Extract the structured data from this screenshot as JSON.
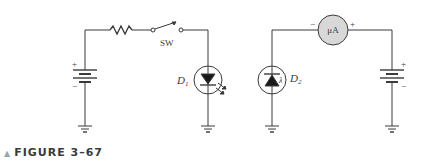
{
  "figure": {
    "caption_marker": "▲",
    "caption": "FIGURE 3–67"
  },
  "left_circuit": {
    "switch_label": "SW",
    "led_label": "D",
    "led_subscript": "1",
    "battery_plus": "+",
    "battery_minus": "−"
  },
  "right_circuit": {
    "meter_label": "μA",
    "meter_minus": "−",
    "meter_plus": "+",
    "photodiode_label": "D",
    "photodiode_subscript": "2",
    "lambda": "λ",
    "battery_plus": "+",
    "battery_minus": "−"
  },
  "colors": {
    "wire": "#3a3a3a",
    "meter_fill": "#d8d8d8"
  }
}
